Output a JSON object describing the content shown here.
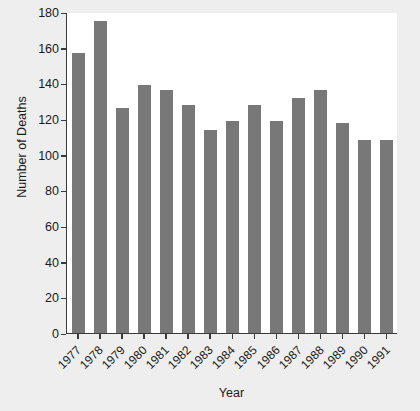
{
  "chart_data": {
    "type": "bar",
    "title": "",
    "xlabel": "Year",
    "ylabel": "Number of Deaths",
    "categories": [
      "1977",
      "1978",
      "1979",
      "1980",
      "1981",
      "1982",
      "1983",
      "1984",
      "1985",
      "1986",
      "1987",
      "1988",
      "1989",
      "1990",
      "1991"
    ],
    "values": [
      157,
      175,
      126,
      139,
      136,
      128,
      114,
      119,
      128,
      119,
      132,
      136,
      118,
      108,
      108
    ],
    "ylim": [
      0,
      180
    ],
    "yticks": [
      0,
      20,
      40,
      60,
      80,
      100,
      120,
      140,
      160,
      180
    ],
    "ytick_labels": [
      "0",
      "20",
      "40",
      "60",
      "80",
      "100",
      "120",
      "140",
      "160",
      "180"
    ],
    "grid": false,
    "legend": null,
    "bar_color": "#787878",
    "plot_background": "#ffffff",
    "figure_background": "#eeeeee",
    "axis_color": "#3a3a3a"
  }
}
